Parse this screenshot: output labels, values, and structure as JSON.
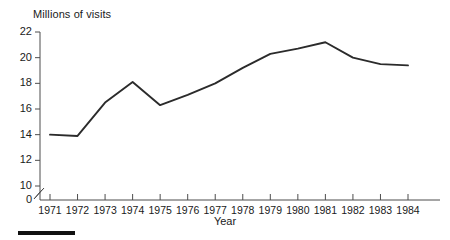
{
  "chart_data": {
    "type": "line",
    "title": "",
    "ylabel": "Millions of visits",
    "xlabel": "Year",
    "categories": [
      "1971",
      "1972",
      "1973",
      "1974",
      "1975",
      "1976",
      "1977",
      "1978",
      "1979",
      "1980",
      "1981",
      "1982",
      "1983",
      "1984"
    ],
    "values": [
      14.0,
      13.9,
      16.5,
      18.1,
      16.3,
      17.1,
      18.0,
      19.2,
      20.3,
      20.7,
      21.2,
      20.0,
      19.5,
      19.4
    ],
    "series": [
      {
        "name": "Millions of visits",
        "values": [
          14.0,
          13.9,
          16.5,
          18.1,
          16.3,
          17.1,
          18.0,
          19.2,
          20.3,
          20.7,
          21.2,
          20.0,
          19.5,
          19.4
        ]
      }
    ],
    "ylim": [
      10,
      22
    ],
    "yticks": [
      10,
      12,
      14,
      16,
      18,
      20,
      22
    ],
    "ytick_labels": [
      "10",
      "12",
      "14",
      "16",
      "18",
      "20",
      "22"
    ],
    "y_origin_label": "0",
    "y_axis_break": true,
    "xlim": [
      "1971",
      "1984"
    ],
    "grid": false,
    "legend": "none",
    "line_color": "#2b2b2b"
  },
  "axes": {
    "y_title": "Millions of visits",
    "x_title": "Year"
  },
  "colors": {
    "line": "#2b2b2b",
    "axis": "#4d4d4d",
    "text": "#1a1a1a",
    "footer_bar": "#111111"
  }
}
